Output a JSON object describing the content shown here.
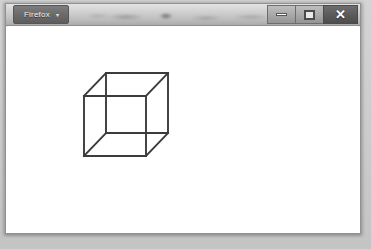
{
  "window": {
    "app_name": "Firefox",
    "menu_button_label": "Firefox",
    "menu_button_caret": "▾",
    "controls": {
      "minimize_label": "—",
      "maximize_label": "□",
      "close_label": "✕"
    },
    "frame_color": "#8f8f8f",
    "titlebar_color": "#cfcfcf",
    "menu_button_color": "#6b6b6b",
    "close_button_color": "#5b5b5b",
    "content_background": "#ffffff"
  },
  "content": {
    "drawing_name": "wireframe-cube",
    "drawing_description": "Necker cube wireframe line drawing",
    "stroke_color": "#3b3b3b",
    "stroke_width": 1.9,
    "geometry": {
      "front_face": [
        [
          78,
          92
        ],
        [
          140,
          92
        ],
        [
          140,
          152
        ],
        [
          78,
          152
        ]
      ],
      "back_face": [
        [
          100,
          69
        ],
        [
          162,
          69
        ],
        [
          162,
          129
        ],
        [
          100,
          129
        ]
      ],
      "connectors": [
        [
          [
            78,
            92
          ],
          [
            100,
            69
          ]
        ],
        [
          [
            140,
            92
          ],
          [
            162,
            69
          ]
        ],
        [
          [
            140,
            152
          ],
          [
            162,
            129
          ]
        ],
        [
          [
            78,
            152
          ],
          [
            100,
            129
          ]
        ]
      ]
    }
  }
}
